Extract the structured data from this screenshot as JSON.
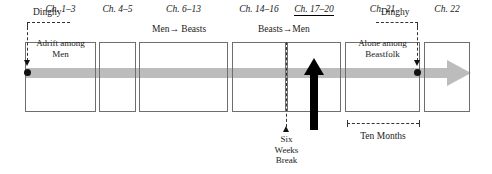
{
  "diagram": {
    "colors": {
      "timeline_gray": "#bcbcbc",
      "box_border": "#6e6e6e",
      "ink": "#1a1a1a",
      "accent_black": "#000000"
    },
    "boxes": [
      {
        "label": "Ch. 1–3",
        "sublabel": "Adrift among\nMen",
        "underlined": false
      },
      {
        "label": "Ch. 4–5",
        "sublabel": "",
        "underlined": false
      },
      {
        "label": "Ch. 6–13",
        "sublabel": "",
        "underlined": false
      },
      {
        "label": "Ch. 14–16",
        "sublabel": "",
        "underlined": false
      },
      {
        "label": "Ch. 17–20",
        "sublabel": "",
        "underlined": true
      },
      {
        "label": "Ch. 21",
        "sublabel": "Alone among\nBeastfolk",
        "underlined": false
      },
      {
        "label": "Ch. 22",
        "sublabel": "",
        "underlined": false
      }
    ],
    "box_sublabels": {
      "adrift_line1": "Adrift among",
      "adrift_line2": "Men",
      "alone_line1": "Alone among",
      "alone_line2": "Beastfolk"
    },
    "section_headers": [
      {
        "text": "Men→ Beasts"
      },
      {
        "text": "Beasts→Men"
      }
    ],
    "annotations": {
      "dinghy_left": "Dinghy",
      "dinghy_right": "Dinghy",
      "six_weeks_line1": "Six",
      "six_weeks_line2": "Weeks",
      "six_weeks_line3": "Break",
      "ten_months": "Ten Months"
    }
  }
}
